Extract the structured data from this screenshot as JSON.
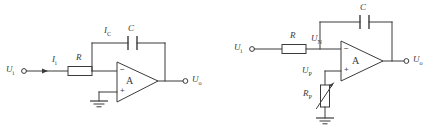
{
  "figure": {
    "background_color": "#ffffff",
    "line_color": "#3a3a3a",
    "width": 427,
    "height": 131
  },
  "circuits": [
    {
      "id": "left-circuit",
      "name": "inverting-integrator",
      "labels": {
        "input_source": "U",
        "input_source_sub": "i",
        "input_current": "I",
        "input_current_sub": "i",
        "resistor": "R",
        "feedback_current": "I",
        "feedback_current_sub": "C",
        "capacitor": "C",
        "amplifier": "A",
        "output": "U",
        "output_sub": "o",
        "inverting_sign": "−",
        "noninverting_sign": "+"
      }
    },
    {
      "id": "right-circuit",
      "name": "integrator-with-balance-resistor",
      "labels": {
        "input_source": "U",
        "input_source_sub": "i",
        "resistor": "R",
        "inverting_node": "U",
        "inverting_node_sub": "N",
        "capacitor": "C",
        "noninverting_node": "U",
        "noninverting_node_sub": "P",
        "balance_resistor": "R",
        "balance_resistor_sub": "P",
        "amplifier": "A",
        "output": "U",
        "output_sub": "o",
        "inverting_sign": "−",
        "noninverting_sign": "+"
      }
    }
  ]
}
